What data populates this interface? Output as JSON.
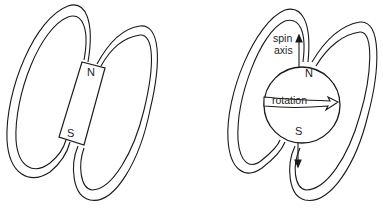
{
  "figure": {
    "left_panel": {
      "title": "bar magnet field",
      "north_label": "N",
      "south_label": "S"
    },
    "right_panel": {
      "title": "rotating body field",
      "north_label": "N",
      "south_label": "S",
      "spin_label_line1": "spin",
      "spin_label_line2": "axis",
      "rotation_label": "rotation"
    },
    "colors": {
      "stroke": "#1a1a1a",
      "background": "#ffffff"
    }
  }
}
